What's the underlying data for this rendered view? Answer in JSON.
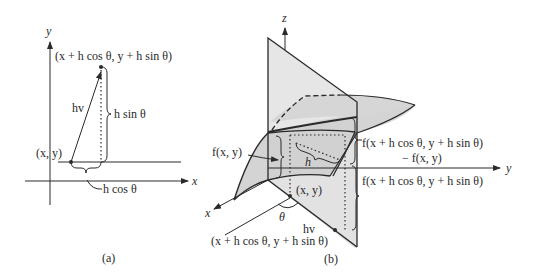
{
  "figure_a": {
    "caption": "(a)",
    "axis_x": "x",
    "axis_y": "y",
    "point_start": "(x, y)",
    "point_end": "(x + h cos θ, y + h sin θ)",
    "vector_label": "hv",
    "vertical_brace": "h sin θ",
    "horizontal_brace": "h cos θ"
  },
  "figure_b": {
    "caption": "(b)",
    "axis_x": "x",
    "axis_y": "y",
    "axis_z": "z",
    "base_point": "(x, y)",
    "end_point": "(x + h cos θ, y + h sin θ)",
    "angle": "θ",
    "vector_label": "hv",
    "h_label": "h",
    "f_base": "f(x, y)",
    "f_diff_line1": "f(x + h cos θ, y + h sin θ)",
    "f_diff_line2": "− f(x, y)",
    "f_end": "f(x + h cos θ, y + h sin θ)"
  },
  "colors": {
    "ink": "#2a2a2a",
    "plane_fill": "#e6e6e6",
    "surface_fill": "#cfcfcf",
    "background": "#ffffff"
  }
}
